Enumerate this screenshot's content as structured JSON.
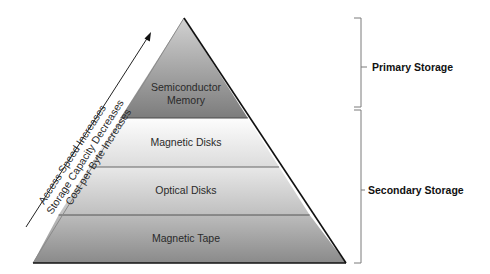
{
  "diagram": {
    "type": "storage-hierarchy-pyramid",
    "layers": [
      {
        "label_line1": "Semiconductor",
        "label_line2": "Memory",
        "fill_top": "#c4c4c4",
        "fill_bottom": "#7e7e7e"
      },
      {
        "label": "Magnetic Disks",
        "fill_top": "#fbfbfb",
        "fill_bottom": "#dedede"
      },
      {
        "label": "Optical Disks",
        "fill_top": "#e6e6e6",
        "fill_bottom": "#c2c2c2"
      },
      {
        "label": "Magnetic Tape",
        "fill_top": "#bdbdbd",
        "fill_bottom": "#8e8e8e"
      }
    ],
    "trend_arrow": {
      "lines": [
        "Access Speed Increases",
        "Storage Capacity Decreases",
        "Cost per Byte Increases"
      ]
    },
    "brackets": [
      {
        "label": "Primary Storage"
      },
      {
        "label": "Secondary Storage"
      }
    ],
    "colors": {
      "outline": "#111111",
      "divider": "#555555",
      "bracket": "#7a7a7a"
    }
  }
}
